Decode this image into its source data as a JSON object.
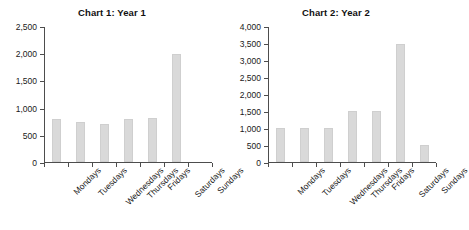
{
  "chart_data": [
    {
      "type": "bar",
      "title": "Chart 1: Year 1",
      "categories": [
        "Mondays",
        "Tuesdays",
        "Wednesdays",
        "Thursdays",
        "Fridays",
        "Saturdays",
        "Sundays"
      ],
      "values": [
        800,
        750,
        700,
        800,
        820,
        2000,
        0
      ],
      "xlabel": "",
      "ylabel": "",
      "ylim": [
        0,
        2500
      ],
      "yticks": [
        0,
        500,
        1000,
        1500,
        2000,
        2500
      ],
      "ytick_labels": [
        "0",
        "500",
        "1,000",
        "1,500",
        "2,000",
        "2,500"
      ],
      "grid": false,
      "legend": false,
      "bar_color": "#d9d9d9"
    },
    {
      "type": "bar",
      "title": "Chart 2: Year 2",
      "categories": [
        "Mondays",
        "Tuesdays",
        "Wednesdays",
        "Thursdays",
        "Fridays",
        "Saturdays",
        "Sundays"
      ],
      "values": [
        1000,
        1000,
        1000,
        1500,
        1500,
        3500,
        500
      ],
      "xlabel": "",
      "ylabel": "",
      "ylim": [
        0,
        4000
      ],
      "yticks": [
        0,
        500,
        1000,
        1500,
        2000,
        2500,
        3000,
        3500,
        4000
      ],
      "ytick_labels": [
        "0",
        "500",
        "1,000",
        "1,500",
        "2,000",
        "2,500",
        "3,000",
        "3,500",
        "4,000"
      ],
      "grid": false,
      "legend": false,
      "bar_color": "#d9d9d9"
    }
  ]
}
